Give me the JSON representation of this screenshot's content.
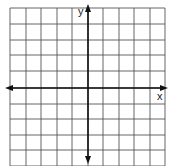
{
  "diagram": {
    "type": "coordinate-grid",
    "x_axis_label": "x",
    "y_axis_label": "y",
    "grid": {
      "columns": 10,
      "rows_visible": 10,
      "vertical_lines_px": [
        10,
        26,
        41,
        57,
        72,
        88,
        103,
        119,
        134,
        150,
        165
      ],
      "horizontal_lines_px": [
        8,
        24,
        40,
        55,
        71,
        88,
        104,
        119,
        135,
        150,
        166
      ],
      "origin_px": [
        88,
        88
      ],
      "grid_color": "#555555",
      "axis_color": "#111111"
    }
  }
}
